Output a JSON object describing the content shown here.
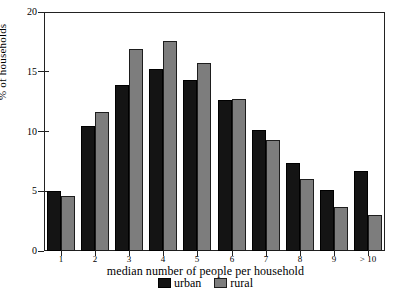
{
  "chart_data": {
    "type": "bar",
    "title": "",
    "xlabel": "median number of people per household",
    "ylabel": "% of households",
    "categories": [
      "1",
      "2",
      "3",
      "4",
      "5",
      "6",
      "7",
      "8",
      "9",
      "> 10"
    ],
    "series": [
      {
        "name": "urban",
        "color": "#141414",
        "values": [
          5.0,
          10.5,
          13.9,
          15.2,
          14.3,
          12.6,
          10.1,
          7.4,
          5.1,
          6.7
        ]
      },
      {
        "name": "rural",
        "color": "#7d7d7d",
        "values": [
          4.6,
          11.6,
          16.9,
          17.6,
          15.7,
          12.7,
          9.3,
          6.0,
          3.7,
          3.0
        ]
      }
    ],
    "ylim": [
      0,
      20
    ],
    "yticks": [
      "0",
      "5",
      "10",
      "15",
      "20"
    ],
    "ytick_values": [
      0,
      5,
      10,
      15,
      20
    ],
    "grid": false,
    "legend_position": "bottom-center",
    "legend_entries": [
      "urban",
      "rural"
    ]
  }
}
